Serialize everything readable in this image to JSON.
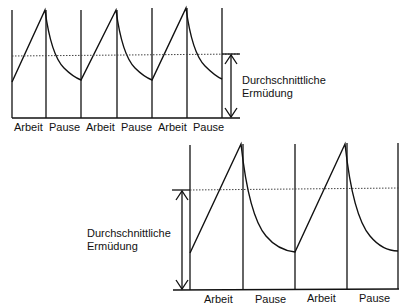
{
  "caption_fragment": "",
  "diagram_top": {
    "title": "Kurze Arbeits- und Pausenzyklen",
    "phases": [
      "Arbeit",
      "Pause",
      "Arbeit",
      "Pause",
      "Arbeit",
      "Pause"
    ],
    "cycles": 3,
    "average_label_line1": "Durchschnittliche",
    "average_label_line2": "Ermüdung"
  },
  "diagram_bottom": {
    "title": "Lange Arbeits- und Pausenzyklen",
    "phases": [
      "Arbeit",
      "Pause",
      "Arbeit",
      "Pause"
    ],
    "cycles": 2,
    "average_label_line1": "Durchschnittliche",
    "average_label_line2": "Ermüdung"
  },
  "notes": {
    "top_average_relative": "lower average fatigue (dotted line nearer baseline relative to peak)",
    "bottom_average_relative": "higher average fatigue"
  }
}
